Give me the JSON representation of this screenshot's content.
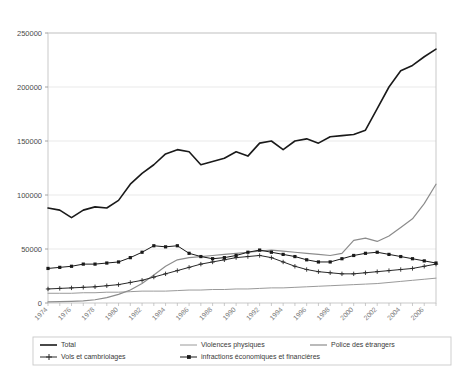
{
  "chart_data": {
    "type": "line",
    "title": "",
    "xlabel": "",
    "ylabel": "",
    "xlim": [
      1974,
      2007
    ],
    "ylim": [
      0,
      250000
    ],
    "grid": true,
    "legend_position": "bottom",
    "x": [
      1974,
      1975,
      1976,
      1977,
      1978,
      1979,
      1980,
      1981,
      1982,
      1983,
      1984,
      1985,
      1986,
      1987,
      1988,
      1989,
      1990,
      1991,
      1992,
      1993,
      1994,
      1995,
      1996,
      1997,
      1998,
      1999,
      2000,
      2001,
      2002,
      2003,
      2004,
      2005,
      2006,
      2007
    ],
    "ytick_labels": [
      "0",
      "50000",
      "100000",
      "150000",
      "200000",
      "250000"
    ],
    "ytick_values": [
      0,
      50000,
      100000,
      150000,
      200000,
      250000
    ],
    "xtick_labels": [
      "1974",
      "1976",
      "1978",
      "1980",
      "1982",
      "1984",
      "1986",
      "1988",
      "1990",
      "1992",
      "1994",
      "1996",
      "1998",
      "2000",
      "2002",
      "2004",
      "2006"
    ],
    "xtick_values": [
      1974,
      1976,
      1978,
      1980,
      1982,
      1984,
      1986,
      1988,
      1990,
      1992,
      1994,
      1996,
      1998,
      2000,
      2002,
      2004,
      2006
    ],
    "series": [
      {
        "name": "Total",
        "marker": "none",
        "color": "#1a1a1a",
        "width": 1.6,
        "values": [
          88000,
          86000,
          79000,
          86000,
          89000,
          88000,
          95000,
          110000,
          120000,
          128000,
          138000,
          142000,
          140000,
          128000,
          131000,
          134000,
          140000,
          136000,
          148000,
          150000,
          142000,
          150000,
          152000,
          148000,
          154000,
          155000,
          156000,
          160000,
          180000,
          200000,
          215000,
          220000,
          228000,
          235000
        ]
      },
      {
        "name": "Violences physiques",
        "marker": "none",
        "color": "#9a9a9a",
        "width": 1.0,
        "values": [
          9000,
          9000,
          9000,
          9500,
          9500,
          10000,
          10000,
          10500,
          11000,
          11000,
          11000,
          11500,
          12000,
          12000,
          12500,
          12500,
          13000,
          13000,
          13500,
          14000,
          14000,
          14500,
          15000,
          15500,
          16000,
          16500,
          17000,
          17500,
          18000,
          19000,
          20000,
          21000,
          22000,
          23000
        ]
      },
      {
        "name": "Police des étrangers",
        "marker": "none",
        "color": "#8c8c8c",
        "width": 1.2,
        "values": [
          1000,
          1200,
          1500,
          2000,
          3000,
          5000,
          8000,
          12000,
          18000,
          26000,
          34000,
          40000,
          42000,
          43000,
          44000,
          45000,
          46000,
          47000,
          48000,
          49000,
          48000,
          47000,
          46000,
          45000,
          44000,
          46000,
          58000,
          60000,
          57000,
          62000,
          70000,
          78000,
          92000,
          110000
        ]
      },
      {
        "name": "Vols et cambriolages",
        "marker": "cross",
        "color": "#2a2a2a",
        "width": 1.0,
        "values": [
          13000,
          13500,
          14000,
          14500,
          15000,
          16000,
          17000,
          19000,
          21000,
          24000,
          27000,
          30000,
          33000,
          36000,
          38000,
          40000,
          42000,
          43000,
          44000,
          42000,
          38000,
          34000,
          31000,
          29000,
          28000,
          27000,
          27000,
          28000,
          29000,
          30000,
          31000,
          32000,
          34000,
          36000
        ]
      },
      {
        "name": "infractions économiques et financières",
        "marker": "square",
        "color": "#1a1a1a",
        "width": 1.0,
        "values": [
          32000,
          33000,
          34000,
          36000,
          36000,
          37000,
          38000,
          42000,
          47000,
          53000,
          52000,
          53000,
          46000,
          43000,
          41000,
          42000,
          44000,
          47000,
          49000,
          47000,
          45000,
          43000,
          40000,
          38000,
          38000,
          41000,
          44000,
          46000,
          47000,
          45000,
          43000,
          41000,
          39000,
          37000
        ]
      }
    ]
  },
  "legend": {
    "items": [
      {
        "label": "Total"
      },
      {
        "label": "Violences physiques"
      },
      {
        "label": "Police des étrangers"
      },
      {
        "label": "Vols et cambriolages"
      },
      {
        "label": "infractions économiques et financières"
      }
    ]
  }
}
